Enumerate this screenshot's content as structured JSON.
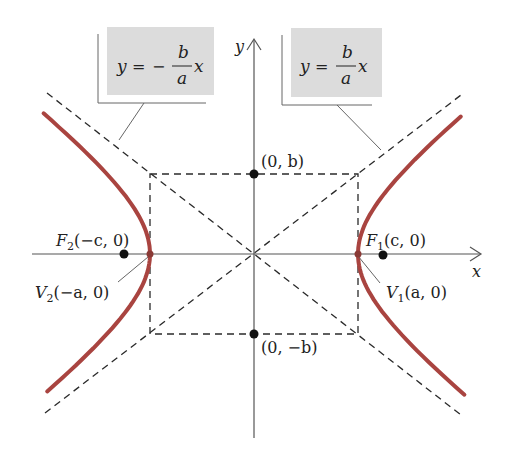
{
  "figure": {
    "axes": {
      "x_label": "x",
      "y_label": "y"
    },
    "asymptotes": [
      {
        "id": "negative",
        "equation_lhs": "y",
        "equation_eq": "=",
        "sign": "−",
        "numerator": "b",
        "denominator": "a",
        "variable": "x"
      },
      {
        "id": "positive",
        "equation_lhs": "y",
        "equation_eq": "=",
        "sign": "",
        "numerator": "b",
        "denominator": "a",
        "variable": "x"
      }
    ],
    "points": {
      "co_vertex_top": "(0, b)",
      "co_vertex_bottom": "(0, −b)",
      "focus_right": {
        "letter": "F",
        "sub": "1",
        "coords": "(c, 0)"
      },
      "focus_left": {
        "letter": "F",
        "sub": "2",
        "coords": "(−c, 0)"
      },
      "vertex_right": {
        "letter": "V",
        "sub": "1",
        "coords": "(a, 0)"
      },
      "vertex_left": {
        "letter": "V",
        "sub": "2",
        "coords": "(−a, 0)"
      }
    },
    "colors": {
      "curve": "#a94440",
      "axis": "#555555",
      "dash": "#2a2a2a",
      "callout_fill": "#dcdcdc",
      "point": "#111111"
    }
  }
}
